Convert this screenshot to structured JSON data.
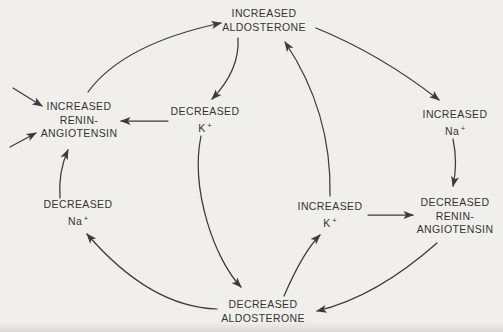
{
  "colors": {
    "background": "#f1efeb",
    "ink": "#3b3b3b"
  },
  "nodes": {
    "increased_aldosterone": {
      "line1": "INCREASED",
      "line2": "ALDOSTERONE"
    },
    "increased_renin_angiotensin": {
      "line1": "INCREASED",
      "line2": "RENIN-",
      "line3": "ANGIOTENSIN"
    },
    "decreased_k": {
      "line1": "DECREASED",
      "ion": "K",
      "sup": "+"
    },
    "increased_na": {
      "line1": "INCREASED",
      "ion": "Na",
      "sup": "+"
    },
    "decreased_na": {
      "line1": "DECREASED",
      "ion": "Na",
      "sup": "+"
    },
    "increased_k": {
      "line1": "INCREASED",
      "ion": "K",
      "sup": "+"
    },
    "decreased_renin_angiotensin": {
      "line1": "DECREASED",
      "line2": "RENIN-",
      "line3": "ANGIOTENSIN"
    },
    "decreased_aldosterone": {
      "line1": "DECREASED",
      "line2": "ALDOSTERONE"
    }
  },
  "edges": [
    {
      "from": "external-stimulus-upper",
      "to": "increased-renin-angiotensin"
    },
    {
      "from": "external-stimulus-lower",
      "to": "increased-renin-angiotensin"
    },
    {
      "from": "increased-renin-angiotensin",
      "to": "increased-aldosterone"
    },
    {
      "from": "increased-aldosterone",
      "to": "decreased-k"
    },
    {
      "from": "decreased-k",
      "to": "increased-renin-angiotensin"
    },
    {
      "from": "decreased-k",
      "to": "decreased-aldosterone"
    },
    {
      "from": "increased-aldosterone",
      "to": "increased-na"
    },
    {
      "from": "increased-na",
      "to": "decreased-renin-angiotensin"
    },
    {
      "from": "increased-k",
      "to": "increased-aldosterone"
    },
    {
      "from": "increased-k",
      "to": "decreased-renin-angiotensin"
    },
    {
      "from": "decreased-aldosterone",
      "to": "increased-k"
    },
    {
      "from": "decreased-renin-angiotensin",
      "to": "decreased-aldosterone"
    },
    {
      "from": "decreased-aldosterone",
      "to": "decreased-na"
    },
    {
      "from": "decreased-na",
      "to": "increased-renin-angiotensin"
    }
  ]
}
